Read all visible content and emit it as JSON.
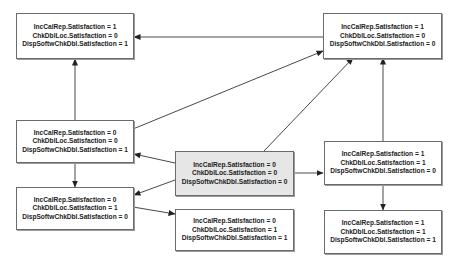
{
  "diagram": {
    "type": "state-transition-graph",
    "colors": {
      "node_fill": "#ffffff",
      "highlight_fill": "#e6e6e6",
      "border": "#6b6b6b",
      "edge": "#333333",
      "text": "#222222"
    },
    "nodes": [
      {
        "id": "A",
        "lines": [
          "IncCalRep.Satisfaction = 1",
          "ChkDblLoc.Satisfaction = 0",
          "DispSoftwChkDbl.Satisfaction = 1"
        ]
      },
      {
        "id": "B",
        "lines": [
          "IncCalRep.Satisfaction = 1",
          "ChkDblLoc.Satisfaction = 0",
          "DispSoftwChkDbl.Satisfaction = 0"
        ]
      },
      {
        "id": "C",
        "lines": [
          "IncCalRep.Satisfaction = 0",
          "ChkDblLoc.Satisfaction = 0",
          "DispSoftwChkDbl.Satisfaction = 1"
        ]
      },
      {
        "id": "D",
        "lines": [
          "IncCalRep.Satisfaction = 0",
          "ChkDblLoc.Satisfaction = 0",
          "DispSoftwChkDbl.Satisfaction = 0"
        ],
        "highlighted": true
      },
      {
        "id": "E",
        "lines": [
          "IncCalRep.Satisfaction = 1",
          "ChkDblLoc.Satisfaction = 1",
          "DispSoftwChkDbl.Satisfaction = 0"
        ]
      },
      {
        "id": "F",
        "lines": [
          "IncCalRep.Satisfaction = 0",
          "ChkDblLoc.Satisfaction = 1",
          "DispSoftwChkDbl.Satisfaction = 0"
        ]
      },
      {
        "id": "G",
        "lines": [
          "IncCalRep.Satisfaction = 0",
          "ChkDblLoc.Satisfaction = 1",
          "DispSoftwChkDbl.Satisfaction = 1"
        ]
      },
      {
        "id": "H",
        "lines": [
          "IncCalRep.Satisfaction = 1",
          "ChkDblLoc.Satisfaction = 1",
          "DispSoftwChkDbl.Satisfaction = 1"
        ]
      }
    ],
    "edges": [
      {
        "from": "B",
        "to": "A"
      },
      {
        "from": "C",
        "to": "A"
      },
      {
        "from": "C",
        "to": "B"
      },
      {
        "from": "D",
        "to": "B"
      },
      {
        "from": "E",
        "to": "B"
      },
      {
        "from": "D",
        "to": "C"
      },
      {
        "from": "D",
        "to": "E"
      },
      {
        "from": "C",
        "to": "F"
      },
      {
        "from": "D",
        "to": "F"
      },
      {
        "from": "F",
        "to": "G"
      },
      {
        "from": "E",
        "to": "H"
      }
    ]
  }
}
